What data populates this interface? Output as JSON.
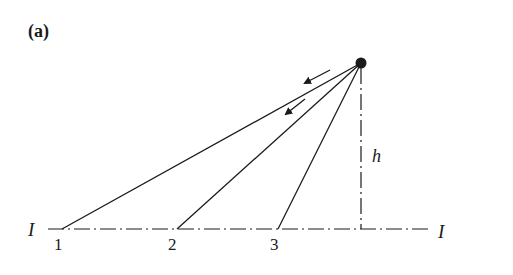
{
  "figure": {
    "panel_label": "(a)",
    "source_point": {
      "cx": 361,
      "cy": 63,
      "r": 5.5
    },
    "height_label": "h",
    "axis_label_left": "I",
    "axis_label_right": "I",
    "axis": {
      "x1": 48,
      "x2": 430,
      "y": 229
    },
    "height_line": {
      "x": 361,
      "y1": 68,
      "y2": 229
    },
    "rays": [
      {
        "id": "1",
        "label": "1",
        "x": 62,
        "y": 229,
        "label_x": 58,
        "label_y": 250
      },
      {
        "id": "2",
        "label": "2",
        "x": 177,
        "y": 229,
        "label_x": 173,
        "label_y": 250
      },
      {
        "id": "3",
        "label": "3",
        "x": 278,
        "y": 229,
        "label_x": 275,
        "label_y": 250
      }
    ],
    "arrows": [
      {
        "x1": 330,
        "y1": 70,
        "x2": 305,
        "y2": 83
      },
      {
        "x1": 305,
        "y1": 99,
        "x2": 285,
        "y2": 115
      }
    ],
    "colors": {
      "stroke": "#1a1a1a",
      "background": "#ffffff"
    }
  }
}
